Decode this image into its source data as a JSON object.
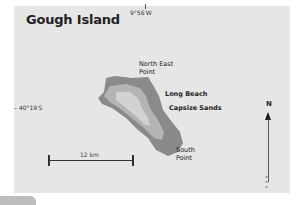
{
  "map": {
    "title": "Gough Island",
    "longitude_label": "9°56′W",
    "latitude_label": "– 40°19′S",
    "places": [
      {
        "name": "North East Point",
        "line1": "North East",
        "line2": "Point"
      },
      {
        "name": "Long Beach",
        "line1": "Long Beach"
      },
      {
        "name": "Capsize Sands",
        "line1": "Capsize Sands"
      },
      {
        "name": "South Point",
        "line1": "South",
        "line2": "Point"
      }
    ],
    "scale": {
      "label": "12 km"
    },
    "north": {
      "label": "N"
    },
    "colors": {
      "background": "#e6e6e6",
      "land_outer": "#8a8a8a",
      "land_mid": "#b4b4b4",
      "land_inner": "#d2d2d2"
    }
  }
}
